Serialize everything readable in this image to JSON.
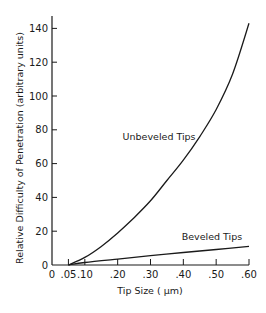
{
  "chart_data": {
    "type": "line",
    "title": "",
    "xlabel": "Tip Size ( μm)",
    "ylabel": "Relative Difficulty of Penetration (arbitrary units)",
    "xlim": [
      0,
      0.6
    ],
    "ylim": [
      0,
      145
    ],
    "grid": false,
    "legend": "inline labels",
    "x_ticks": [
      {
        "value": 0,
        "label": "0"
      },
      {
        "value": 0.05,
        "label": ".05"
      },
      {
        "value": 0.1,
        "label": ".10"
      },
      {
        "value": 0.2,
        "label": ".20"
      },
      {
        "value": 0.3,
        "label": ".30"
      },
      {
        "value": 0.4,
        "label": ".40"
      },
      {
        "value": 0.5,
        "label": ".50"
      },
      {
        "value": 0.6,
        "label": ".60"
      }
    ],
    "y_ticks": [
      {
        "value": 0,
        "label": "0"
      },
      {
        "value": 20,
        "label": "20"
      },
      {
        "value": 40,
        "label": "40"
      },
      {
        "value": 60,
        "label": "60"
      },
      {
        "value": 80,
        "label": "80"
      },
      {
        "value": 100,
        "label": "100"
      },
      {
        "value": 120,
        "label": "120"
      },
      {
        "value": 140,
        "label": "140"
      }
    ],
    "series": [
      {
        "name": "Unbeveled Tips",
        "label_pos": {
          "x": 0.215,
          "y": 74
        },
        "x": [
          0.05,
          0.1,
          0.15,
          0.2,
          0.25,
          0.3,
          0.35,
          0.4,
          0.45,
          0.5,
          0.55,
          0.6
        ],
        "values": [
          0,
          4.5,
          11,
          19,
          28,
          38,
          50,
          62,
          76,
          92,
          113,
          143
        ]
      },
      {
        "name": "Beveled Tips",
        "label_pos": {
          "x": 0.395,
          "y": 15
        },
        "x": [
          0.05,
          0.1,
          0.2,
          0.3,
          0.4,
          0.5,
          0.6
        ],
        "values": [
          0,
          1.5,
          3.5,
          5.5,
          7.4,
          9.2,
          11
        ]
      }
    ]
  }
}
